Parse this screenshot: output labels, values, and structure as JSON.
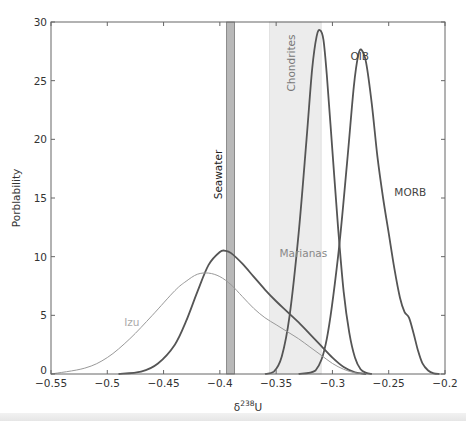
{
  "chart_data": {
    "type": "line",
    "title": "",
    "xlabel": "δ238U",
    "xlabel_parts": {
      "base": "δ",
      "sup": "238",
      "tail": "U"
    },
    "ylabel": "Porblability",
    "xlim": [
      -0.55,
      -0.2
    ],
    "ylim": [
      0,
      30
    ],
    "xticks": [
      -0.55,
      -0.5,
      -0.45,
      -0.4,
      -0.35,
      -0.3,
      -0.25,
      -0.2
    ],
    "xtick_labels": [
      "−0.55",
      "−0.5",
      "−0.45",
      "−0.4",
      "−0.35",
      "−0.3",
      "−0.25",
      "−0.2"
    ],
    "yticks": [
      0,
      5,
      10,
      15,
      20,
      25,
      30
    ],
    "ytick_labels": [
      "0",
      "5",
      "10",
      "15",
      "20",
      "25",
      "30"
    ],
    "grid": false,
    "legend": "none (inline annotations)",
    "bands": [
      {
        "name": "Seawater",
        "x0": -0.394,
        "x1": -0.387,
        "color": "#b8b8b8",
        "edge": "#777777",
        "label_color": "#222222"
      },
      {
        "name": "Chondrites",
        "x0": -0.356,
        "x1": -0.31,
        "color": "#ececec",
        "edge": "#dddddd",
        "label_color": "#777777"
      }
    ],
    "series": [
      {
        "name": "MORB",
        "color": "#555555",
        "width": 1.8,
        "x": [
          -0.33,
          -0.315,
          -0.305,
          -0.295,
          -0.287,
          -0.281,
          -0.277,
          -0.274,
          -0.27,
          -0.265,
          -0.26,
          -0.255,
          -0.25,
          -0.245,
          -0.24,
          -0.236,
          -0.232,
          -0.228,
          -0.224,
          -0.22,
          -0.215,
          -0.21,
          -0.205
        ],
        "values": [
          0,
          0.3,
          3,
          10,
          18,
          24.5,
          27.2,
          27.6,
          26.5,
          23,
          18.5,
          15,
          12,
          9,
          6.5,
          5.3,
          4.8,
          3.5,
          2,
          0.9,
          0.3,
          0.05,
          0
        ]
      },
      {
        "name": "OIB",
        "color": "#555555",
        "width": 1.8,
        "x": [
          -0.36,
          -0.352,
          -0.345,
          -0.338,
          -0.33,
          -0.323,
          -0.318,
          -0.314,
          -0.311,
          -0.308,
          -0.305,
          -0.3,
          -0.295,
          -0.29,
          -0.285,
          -0.28,
          -0.275,
          -0.27,
          -0.265
        ],
        "values": [
          0,
          0.2,
          1.5,
          5,
          12,
          20,
          26,
          28.8,
          29.3,
          28.5,
          25.5,
          19,
          12.5,
          7,
          3.5,
          1.4,
          0.4,
          0.1,
          0
        ]
      },
      {
        "name": "Marianas",
        "color": "#555555",
        "width": 1.8,
        "x": [
          -0.49,
          -0.47,
          -0.455,
          -0.44,
          -0.43,
          -0.42,
          -0.41,
          -0.4,
          -0.395,
          -0.39,
          -0.38,
          -0.37,
          -0.36,
          -0.35,
          -0.34,
          -0.33,
          -0.32,
          -0.31,
          -0.3,
          -0.29,
          -0.28,
          -0.27
        ],
        "values": [
          0,
          0.2,
          0.9,
          2.5,
          4.5,
          7,
          9.3,
          10.4,
          10.5,
          10.3,
          9.4,
          8.3,
          7.2,
          6.2,
          5.3,
          4.4,
          3.4,
          2.4,
          1.4,
          0.6,
          0.15,
          0
        ]
      },
      {
        "name": "Izu",
        "color": "#999999",
        "width": 1.0,
        "x": [
          -0.55,
          -0.52,
          -0.5,
          -0.48,
          -0.46,
          -0.44,
          -0.43,
          -0.42,
          -0.41,
          -0.4,
          -0.39,
          -0.38,
          -0.37,
          -0.36,
          -0.35,
          -0.34,
          -0.33,
          -0.32,
          -0.31,
          -0.3,
          -0.29,
          -0.28,
          -0.27
        ],
        "values": [
          0,
          0.5,
          1.4,
          3,
          5,
          7.1,
          7.9,
          8.5,
          8.6,
          8.3,
          7.6,
          6.6,
          5.6,
          4.8,
          4.2,
          3.6,
          3.0,
          2.3,
          1.6,
          0.9,
          0.4,
          0.1,
          0
        ]
      }
    ],
    "annotations": [
      {
        "text": "OIB",
        "x": -0.284,
        "y": 26.8,
        "color": "#444444",
        "rotate": 0
      },
      {
        "text": "MORB",
        "x": -0.245,
        "y": 15.2,
        "color": "#444444",
        "rotate": 0
      },
      {
        "text": "Marianas",
        "x": -0.347,
        "y": 10.0,
        "color": "#888888",
        "rotate": 0
      },
      {
        "text": "Izu",
        "x": -0.485,
        "y": 4.1,
        "color": "#aaaaaa",
        "rotate": 0
      },
      {
        "text": "Seawater",
        "x": -0.398,
        "y": 17.0,
        "color": "#222222",
        "rotate": -90
      },
      {
        "text": "Chondrites",
        "x": -0.333,
        "y": 26.5,
        "color": "#777777",
        "rotate": -90
      }
    ]
  }
}
